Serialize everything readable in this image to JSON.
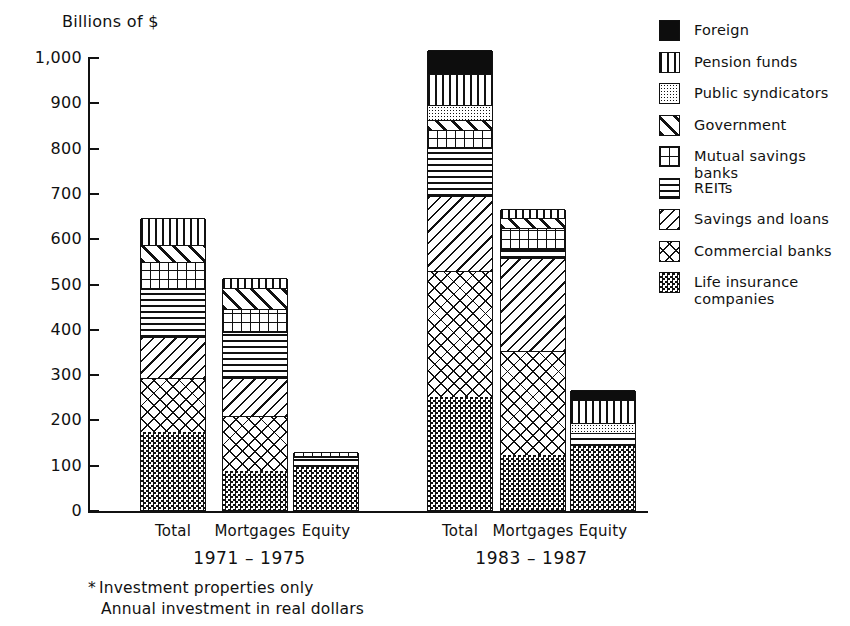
{
  "chart_data": {
    "type": "bar",
    "subtype": "stacked",
    "title": "",
    "ylabel": "Billions of $",
    "xlabel": "",
    "ylim": [
      0,
      1000
    ],
    "ytick_labels": [
      "1,000",
      "900",
      "800",
      "700",
      "600",
      "500",
      "400",
      "300",
      "200",
      "100",
      "0"
    ],
    "ytick_values": [
      1000,
      900,
      800,
      700,
      600,
      500,
      400,
      300,
      200,
      100,
      0
    ],
    "grid": false,
    "legend_position": "right",
    "groups": [
      {
        "label": "1971 – 1975",
        "categories": [
          "Total",
          "Mortgages",
          "Equity"
        ]
      },
      {
        "label": "1983 – 1987",
        "categories": [
          "Total",
          "Mortgages",
          "Equity"
        ]
      }
    ],
    "categories": [
      "1971-1975 Total",
      "1971-1975 Mortgages",
      "1971-1975 Equity",
      "1983-1987 Total",
      "1983-1987 Mortgages",
      "1983-1987 Equity"
    ],
    "series": [
      {
        "name": "Life insurance companies",
        "pattern": "life",
        "values": [
          173,
          86,
          96,
          250,
          122,
          142
        ]
      },
      {
        "name": "Commercial banks",
        "pattern": "commercial",
        "values": [
          118,
          122,
          0,
          278,
          228,
          0
        ]
      },
      {
        "name": "Savings and loans",
        "pattern": "savings",
        "values": [
          90,
          83,
          0,
          165,
          207,
          0
        ]
      },
      {
        "name": "REITs",
        "pattern": "reits",
        "values": [
          106,
          102,
          20,
          106,
          19,
          29
        ]
      },
      {
        "name": "Mutual savings banks",
        "pattern": "mutual",
        "values": [
          60,
          50,
          11,
          40,
          46,
          0
        ]
      },
      {
        "name": "Government",
        "pattern": "government",
        "values": [
          39,
          48,
          0,
          21,
          22,
          0
        ]
      },
      {
        "name": "Public syndicators",
        "pattern": "public",
        "values": [
          0,
          0,
          0,
          35,
          0,
          20
        ]
      },
      {
        "name": "Pension funds",
        "pattern": "pension",
        "values": [
          59,
          21,
          0,
          67,
          20,
          52
        ]
      },
      {
        "name": "Foreign",
        "pattern": "foreign",
        "values": [
          0,
          0,
          0,
          53,
          0,
          21
        ]
      }
    ],
    "totals": [
      645,
      512,
      127,
      1015,
      664,
      264
    ]
  },
  "legend": {
    "items": [
      {
        "label": "Foreign",
        "pattern": "foreign"
      },
      {
        "label": "Pension funds",
        "pattern": "pension"
      },
      {
        "label": "Public syndicators",
        "pattern": "public"
      },
      {
        "label": "Government",
        "pattern": "government"
      },
      {
        "label": "Mutual savings banks",
        "pattern": "mutual"
      },
      {
        "label": "REITs",
        "pattern": "reits"
      },
      {
        "label": "Savings and loans",
        "pattern": "savings"
      },
      {
        "label": "Commercial banks",
        "pattern": "commercial"
      },
      {
        "label": "Life insurance\ncompanies",
        "pattern": "life"
      }
    ]
  },
  "footnote": {
    "marker": "*",
    "line1": "Investment properties only",
    "line2": "Annual investment in real dollars"
  },
  "colors": {
    "ink": "#111111",
    "paper": "#ffffff"
  }
}
